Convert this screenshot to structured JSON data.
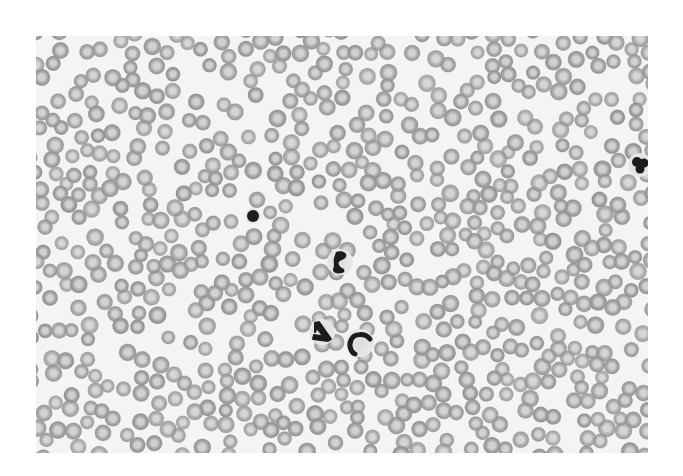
{
  "image": {
    "description": "Grayscale light micrograph of a peripheral blood smear showing densely packed red blood cells with a few darkly stained white blood cells",
    "frame": {
      "x": 36,
      "y": 36,
      "width": 612,
      "height": 417
    },
    "colors": {
      "page_background": "#ffffff",
      "smear_background": "#f4f4f4",
      "rbc_rim": "#8e8e8e",
      "rbc_body": "#a8a8a8",
      "rbc_center": "#cfcfcf",
      "nucleus": "#1c1c1c",
      "cytoplasm": "#dcdcdc"
    },
    "rbc": {
      "count": 720,
      "radius_min": 7,
      "radius_max": 9,
      "seed": 1337
    },
    "wbc": [
      {
        "type": "lymphocyte",
        "x": 217,
        "y": 180,
        "shape": "round",
        "r": 6
      },
      {
        "type": "band-neutrophil",
        "x": 304,
        "y": 226,
        "shape": "segmented"
      },
      {
        "type": "neutrophil",
        "x": 286,
        "y": 296,
        "shape": "triangle"
      },
      {
        "type": "band-neutrophil",
        "x": 324,
        "y": 307,
        "shape": "c-shape"
      },
      {
        "type": "neutrophil",
        "x": 604,
        "y": 129,
        "shape": "lobed"
      }
    ]
  }
}
